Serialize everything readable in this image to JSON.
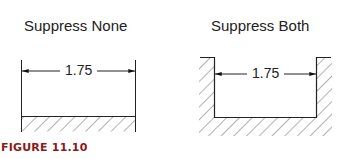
{
  "figure": {
    "caption": "FIGURE 11.10",
    "caption_color": "#8b1a1a"
  },
  "panels": [
    {
      "title": "Suppress None",
      "dimension": "1.75",
      "description": "extension lines drawn on both sides; hatched base below"
    },
    {
      "title": "Suppress Both",
      "dimension": "1.75",
      "description": "both extension lines suppressed; slot in hatched material"
    }
  ]
}
